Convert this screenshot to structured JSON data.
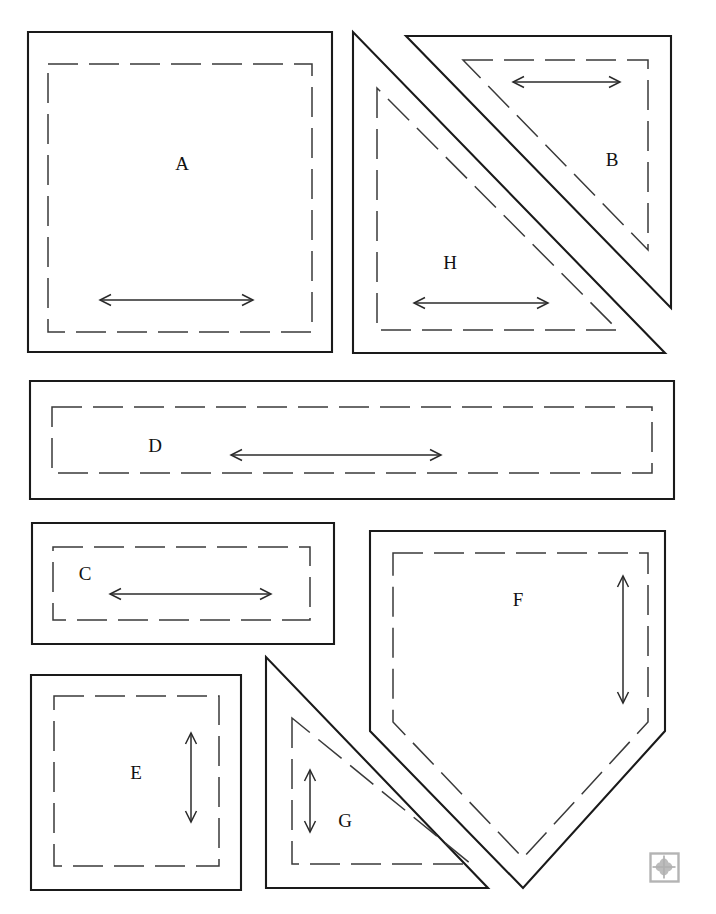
{
  "document": {
    "kind": "quilt-pattern-template-sheet",
    "background_color": "#ffffff",
    "line_color": "#1a1a1a",
    "width": 716,
    "height": 914,
    "piece_count": 8
  },
  "pieces": [
    {
      "id": "A",
      "label": "A",
      "shape": "square",
      "label_x": 182,
      "label_y": 166,
      "cut_points": "28,32 332,32 332,352 28,352",
      "seam_points": "48,64 312,64 312,332 48,332",
      "grain": {
        "orientation": "horizontal",
        "x1": 100,
        "y1": 300,
        "x2": 253,
        "y2": 300
      }
    },
    {
      "id": "H",
      "label": "H",
      "shape": "right-triangle",
      "label_x": 450,
      "label_y": 265,
      "cut_points": "353,32 353,353 665,353",
      "seam_points": "377,88 377,330 618,330",
      "grain": {
        "orientation": "horizontal",
        "x1": 414,
        "y1": 303,
        "x2": 548,
        "y2": 303
      }
    },
    {
      "id": "B",
      "label": "B",
      "shape": "right-triangle",
      "label_x": 612,
      "label_y": 162,
      "cut_points": "406,36 671,36 671,308",
      "seam_points": "463,60 648,60 648,250",
      "grain": {
        "orientation": "horizontal",
        "x1": 513,
        "y1": 82,
        "x2": 620,
        "y2": 82
      }
    },
    {
      "id": "D",
      "label": "D",
      "shape": "rectangle",
      "label_x": 155,
      "label_y": 448,
      "cut_points": "30,381 674,381 674,499 30,499",
      "seam_points": "52,407 652,407 652,473 52,473",
      "grain": {
        "orientation": "horizontal",
        "x1": 231,
        "y1": 455,
        "x2": 441,
        "y2": 455
      }
    },
    {
      "id": "C",
      "label": "C",
      "shape": "rectangle",
      "label_x": 85,
      "label_y": 576,
      "cut_points": "32,523 334,523 334,644 32,644",
      "seam_points": "53,547 310,547 310,620 53,620",
      "grain": {
        "orientation": "horizontal",
        "x1": 110,
        "y1": 594,
        "x2": 271,
        "y2": 594
      }
    },
    {
      "id": "F",
      "label": "F",
      "shape": "pentagon",
      "label_x": 518,
      "label_y": 602,
      "cut_points": "370,531 665,531 665,731 523,888 370,731",
      "seam_points": "393,553 648,553 648,722 523,858 393,722",
      "grain": {
        "orientation": "vertical",
        "x1": 623,
        "y1": 576,
        "x2": 623,
        "y2": 703
      }
    },
    {
      "id": "E",
      "label": "E",
      "shape": "square",
      "label_x": 136,
      "label_y": 775,
      "cut_points": "31,675 241,675 241,890 31,890",
      "seam_points": "54,696 219,696 219,866 54,866",
      "grain": {
        "orientation": "vertical",
        "x1": 191,
        "y1": 733,
        "x2": 191,
        "y2": 822
      }
    },
    {
      "id": "G",
      "label": "G",
      "shape": "right-triangle",
      "label_x": 345,
      "label_y": 823,
      "cut_points": "266,657 266,888 488,888",
      "seam_points": "292,718 292,864 471,864",
      "grain": {
        "orientation": "vertical",
        "x1": 310,
        "y1": 770,
        "x2": 310,
        "y2": 832
      }
    }
  ],
  "logo": {
    "name": "publisher-clover-logo",
    "x": 650,
    "y": 853,
    "size": 28,
    "color": "#b4b4b4"
  }
}
